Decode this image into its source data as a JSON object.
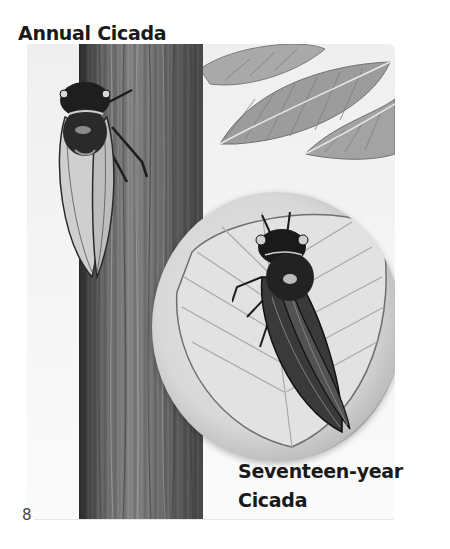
{
  "page": {
    "page_number": "8",
    "captions": {
      "annual": "Annual Cicada",
      "seventeen_line1": "Seventeen-year",
      "seventeen_line2": "Cicada"
    },
    "illustration": {
      "style": "grayscale painted illustration",
      "elements": [
        "tree-trunk",
        "annual-cicada-on-trunk",
        "background-leaves",
        "circular-leaf-inset",
        "seventeen-year-cicada-on-leaf"
      ]
    },
    "colors": {
      "text": "#1a1a1a",
      "page_background": "#ffffff",
      "trunk_dark": "#2c2c2c",
      "trunk_mid": "#8a8a8a",
      "leaf_light": "#e0e0e0",
      "leaf_rim": "#5a5a5a"
    }
  }
}
